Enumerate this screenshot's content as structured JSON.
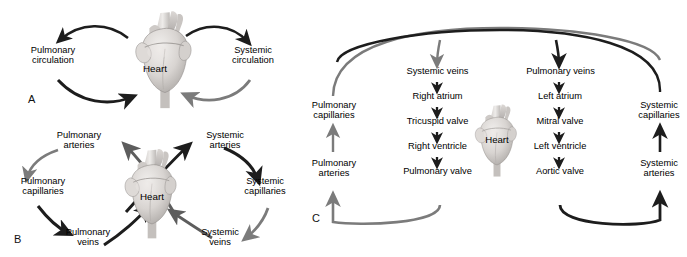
{
  "figure": {
    "background": "#ffffff",
    "dark_arrow_color": "#1d1d1d",
    "gray_arrow_color": "#7b7b7b",
    "heart_label": "Heart"
  },
  "panels": [
    {
      "letter": "A",
      "heart_label": "Heart",
      "labels": [
        {
          "text": "Pulmonary\ncirculation"
        },
        {
          "text": "Systemic\ncirculation"
        }
      ],
      "arrows": [
        {
          "name": "heart-to-pulmonary-circulation",
          "color": "#1d1d1d"
        },
        {
          "name": "pulmonary-circulation-to-heart",
          "color": "#1d1d1d"
        },
        {
          "name": "heart-to-systemic-circulation",
          "color": "#1d1d1d"
        },
        {
          "name": "systemic-circulation-to-heart",
          "color": "#7b7b7b"
        }
      ]
    },
    {
      "letter": "B",
      "heart_label": "Heart",
      "labels": [
        {
          "text": "Pulmonary\narteries"
        },
        {
          "text": "Pulmonary\ncapillaries"
        },
        {
          "text": "Pulmonary\nveins"
        },
        {
          "text": "Systemic\narteries"
        },
        {
          "text": "Systemic\ncapillaries"
        },
        {
          "text": "Systemic\nveins"
        }
      ],
      "arrows": [
        {
          "name": "pulmonary-arteries-to-capillaries",
          "color": "#7b7b7b"
        },
        {
          "name": "pulmonary-capillaries-to-veins",
          "color": "#1d1d1d"
        },
        {
          "name": "pulmonary-veins-to-heart",
          "color": "#1d1d1d"
        },
        {
          "name": "heart-to-pulmonary-arteries",
          "color": "#5d5d5d"
        },
        {
          "name": "heart-to-systemic-arteries",
          "color": "#1d1d1d"
        },
        {
          "name": "systemic-arteries-to-capillaries",
          "color": "#1d1d1d"
        },
        {
          "name": "systemic-capillaries-to-veins",
          "color": "#7b7b7b"
        },
        {
          "name": "systemic-veins-to-heart",
          "color": "#5d5d5d"
        }
      ]
    },
    {
      "letter": "C",
      "heart_label": "Heart",
      "left_loop": {
        "name": "pulmonary-circuit",
        "steps": [
          "Pulmonary capillaries",
          "Pulmonary arteries"
        ],
        "chain": [
          "Systemic veins",
          "Right atrium",
          "Tricuspid valve",
          "Right ventricle",
          "Pulmonary valve"
        ]
      },
      "right_loop": {
        "name": "systemic-circuit",
        "steps": [
          "Systemic capillaries",
          "Systemic arteries"
        ],
        "chain": [
          "Pulmonary veins",
          "Left atrium",
          "Mitral valve",
          "Left ventricle",
          "Aortic valve"
        ]
      },
      "labels": {
        "pulmonary_capillaries": "Pulmonary\ncapillaries",
        "pulmonary_arteries": "Pulmonary\narteries",
        "systemic_capillaries": "Systemic\ncapillaries",
        "systemic_arteries": "Systemic\narteries",
        "systemic_veins": "Systemic veins",
        "right_atrium": "Right atrium",
        "tricuspid_valve": "Tricuspid valve",
        "right_ventricle": "Right ventricle",
        "pulmonary_valve": "Pulmonary valve",
        "pulmonary_veins": "Pulmonary veins",
        "left_atrium": "Left atrium",
        "mitral_valve": "Mitral valve",
        "left_ventricle": "Left ventricle",
        "aortic_valve": "Aortic valve"
      }
    }
  ]
}
